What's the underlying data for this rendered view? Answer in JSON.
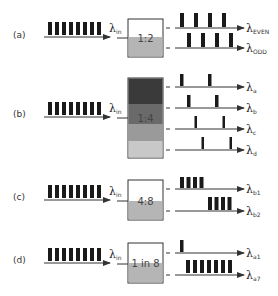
{
  "colors": {
    "pulse": "#1a1a1a",
    "line": "#333333",
    "box_border": "#333333",
    "fill_gray": "#b5b5b5",
    "band_1": "#3a3a3a",
    "band_2": "#6a6a6a",
    "band_3": "#9a9a9a",
    "band_4": "#c8c8c8"
  },
  "input_label": "λ",
  "input_sub": "in",
  "panels": [
    {
      "id": "a",
      "label": "(a)",
      "box_text": "1:2",
      "input_pulses": 8,
      "outputs": [
        {
          "lambda": "λ",
          "sub": "EVEN",
          "pulses": "every other (1st,3rd,5th,7th)",
          "count": 4
        },
        {
          "lambda": "λ",
          "sub": "ODD",
          "pulses": "every other (2nd,4th,6th,8th)",
          "count": 4
        }
      ]
    },
    {
      "id": "b",
      "label": "(b)",
      "box_text": "1:4",
      "input_pulses": 8,
      "outputs": [
        {
          "lambda": "λ",
          "sub": "a",
          "count": 2
        },
        {
          "lambda": "λ",
          "sub": "b",
          "count": 2
        },
        {
          "lambda": "λ",
          "sub": "c",
          "count": 2
        },
        {
          "lambda": "λ",
          "sub": "d",
          "count": 2
        }
      ]
    },
    {
      "id": "c",
      "label": "(c)",
      "box_text": "4:8",
      "input_pulses": 8,
      "outputs": [
        {
          "lambda": "λ",
          "sub": "b1",
          "count": 4
        },
        {
          "lambda": "λ",
          "sub": "b2",
          "count": 4
        }
      ]
    },
    {
      "id": "d",
      "label": "(d)",
      "box_text": "1 in 8",
      "input_pulses": 8,
      "outputs": [
        {
          "lambda": "λ",
          "sub": "a1",
          "count": 1
        },
        {
          "lambda": "λ",
          "sub": "a7",
          "count": 7
        }
      ]
    }
  ]
}
